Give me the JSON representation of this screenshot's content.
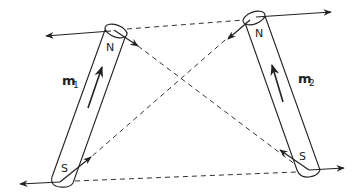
{
  "diagram": {
    "type": "magnetic-force-diagram",
    "colors": {
      "line": "#222222",
      "background": "#ffffff"
    },
    "magnets": [
      {
        "id": "m1",
        "label": "m",
        "subscript": "1",
        "north_label": "N",
        "south_label": "S"
      },
      {
        "id": "m2",
        "label": "m",
        "subscript": "2",
        "north_label": "N",
        "south_label": "S"
      }
    ]
  }
}
